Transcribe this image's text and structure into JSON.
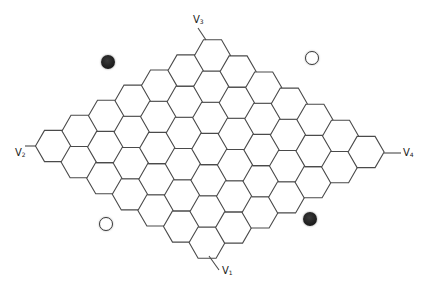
{
  "diagram": {
    "type": "hex-board",
    "board_size": 7,
    "hex_orientation": "flat-top",
    "hex_side": 18,
    "origin_left_corner_center": [
      53.5,
      146
    ],
    "axis_toward_top": [
      26.5,
      -15.1
    ],
    "axis_toward_right": [
      25.6,
      16.1
    ],
    "stroke_color": "#4a4a4a",
    "fill_color": "#ffffff"
  },
  "vertices": [
    {
      "id": "v1",
      "name": "V",
      "sub": "1",
      "label_x": 222,
      "label_y": 266,
      "stub": [
        [
          209,
          256
        ],
        [
          219,
          270
        ]
      ]
    },
    {
      "id": "v2",
      "name": "V",
      "sub": "2",
      "label_x": 15,
      "label_y": 148,
      "stub": [
        [
          25,
          146
        ],
        [
          36,
          146
        ]
      ]
    },
    {
      "id": "v3",
      "name": "V",
      "sub": "3",
      "label_x": 193,
      "label_y": 15,
      "stub": [
        [
          198,
          28
        ],
        [
          206,
          40
        ]
      ]
    },
    {
      "id": "v4",
      "name": "V",
      "sub": "4",
      "label_x": 403,
      "label_y": 148,
      "stub": [
        [
          384,
          153
        ],
        [
          401,
          153
        ]
      ]
    }
  ],
  "stones": [
    {
      "color": "black",
      "x": 108,
      "y": 62
    },
    {
      "color": "white",
      "x": 312,
      "y": 58
    },
    {
      "color": "white",
      "x": 106,
      "y": 224
    },
    {
      "color": "black",
      "x": 310,
      "y": 219
    }
  ],
  "colors": {
    "black_stone": "#1f1f1f",
    "white_stone_border": "#3a3a3a",
    "background": "#ffffff"
  }
}
